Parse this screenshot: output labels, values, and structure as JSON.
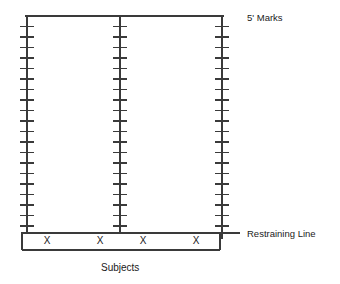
{
  "diagram": {
    "title_label_top": "5' Marks",
    "label_restraining_line": "Restraining Line",
    "label_subjects": "Subjects",
    "stroke_color": "#3a3a3a",
    "text_color": "#1a1a1a",
    "background_color": "#ffffff",
    "subject_marks": [
      {
        "symbol": "X",
        "x": 47,
        "y": 241
      },
      {
        "symbol": "X",
        "x": 100,
        "y": 241
      },
      {
        "symbol": "X",
        "x": 143,
        "y": 241
      },
      {
        "symbol": "X",
        "x": 196,
        "y": 241
      }
    ],
    "geometry": {
      "top_line_y": 16,
      "restraining_line_y": 233,
      "box_bottom_y": 250,
      "box_left_x": 22,
      "box_right_x": 220,
      "left_lane_x": 27,
      "center_lane_x": 120,
      "right_lane_x": 222,
      "tick_half_width": 7,
      "tick_spacing": 10.5,
      "tick_count_outer": 21,
      "tick_count_center": 20
    }
  }
}
